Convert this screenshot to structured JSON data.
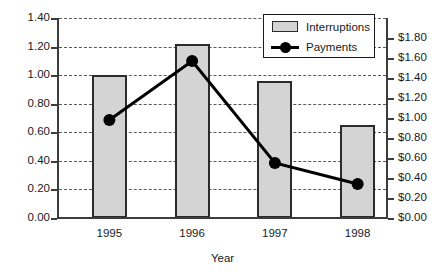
{
  "chart_data": {
    "type": "bar",
    "title": "",
    "subtitle": "",
    "xlabel": "Year",
    "ylabel": "",
    "categories": [
      "1995",
      "1996",
      "1997",
      "1998"
    ],
    "grid": true,
    "legend_position": "top-right",
    "left_axis": {
      "ylim": [
        0.0,
        1.4
      ],
      "tick_step": 0.2,
      "ticks": [
        "0.00",
        "0.20",
        "0.40",
        "0.60",
        "0.80",
        "1.00",
        "1.20",
        "1.40"
      ],
      "tick_values": [
        0.0,
        0.2,
        0.4,
        0.6,
        0.8,
        1.0,
        1.2,
        1.4
      ],
      "series_name": "Interruptions"
    },
    "right_axis": {
      "ylim": [
        0.0,
        1.8
      ],
      "tick_step": 0.2,
      "ticks": [
        "$0.00",
        "$0.20",
        "$0.40",
        "$0.60",
        "$0.80",
        "$1.00",
        "$1.20",
        "$1.40",
        "$1.60",
        "$1.80"
      ],
      "tick_values": [
        0.0,
        0.2,
        0.4,
        0.6,
        0.8,
        1.0,
        1.2,
        1.4,
        1.6,
        1.8
      ],
      "series_name": "Payments"
    },
    "series": [
      {
        "name": "Interruptions",
        "type": "bar",
        "axis": "left",
        "color": "#d4d4d4",
        "edge_color": "#2b2b2b",
        "values": [
          1.0,
          1.22,
          0.96,
          0.65
        ]
      },
      {
        "name": "Payments",
        "type": "line",
        "axis": "right",
        "color": "#000000",
        "marker": "circle",
        "values": [
          0.98,
          1.57,
          0.55,
          0.34
        ]
      }
    ]
  },
  "legend": {
    "items": [
      {
        "label": "Interruptions",
        "swatch": "bar"
      },
      {
        "label": "Payments",
        "swatch": "line-marker"
      }
    ]
  },
  "colors": {
    "bar_fill": "#d4d4d4",
    "bar_edge": "#2b2b2b",
    "line": "#000000",
    "axis": "#3d3d3d",
    "grid": "#5a5a5a",
    "text": "#1a1a1a",
    "background": "#ffffff"
  }
}
